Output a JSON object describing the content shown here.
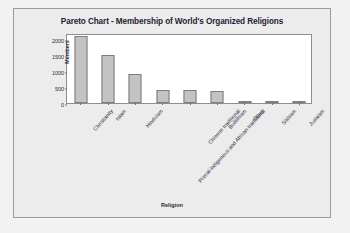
{
  "chart_data": {
    "type": "bar",
    "title": "Pareto Chart - Membership of World's Organized Religions",
    "xlabel": "Religion",
    "ylabel": "Members",
    "categories": [
      "Christianity",
      "Islam",
      "Hinduism",
      "Primal-indigenous and African traditional",
      "Chinese traditional",
      "Buddhism",
      "Other",
      "Sikhism",
      "Judaism"
    ],
    "values": [
      2100,
      1500,
      900,
      400,
      394,
      376,
      50,
      23,
      14
    ],
    "ylim": [
      0,
      2200
    ],
    "yticks": [
      0,
      500,
      1000,
      1500,
      2000
    ],
    "ytick_labels": [
      "0",
      "500",
      "1000",
      "1500",
      "2000"
    ],
    "grid": false,
    "legend": false,
    "bar_color": "#c3c3c3",
    "bar_edge_color": "#7d7d7d",
    "plot_background": "#ffffff",
    "panel_background": "#ececec",
    "text_color": "#2b2b3d"
  }
}
